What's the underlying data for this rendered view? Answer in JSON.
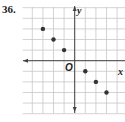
{
  "problem": {
    "number": "36."
  },
  "chart_data": {
    "type": "scatter",
    "title": "",
    "xlabel": "x",
    "ylabel": "y",
    "origin_label": "O",
    "xlim": [
      -5,
      5
    ],
    "ylim": [
      -5,
      5
    ],
    "grid": true,
    "x": [
      -3,
      -2,
      -1,
      1,
      2,
      3
    ],
    "y": [
      3,
      2,
      1,
      -1,
      -2,
      -3
    ],
    "points": [
      [
        -3,
        3
      ],
      [
        -2,
        2
      ],
      [
        -1,
        1
      ],
      [
        1,
        -1
      ],
      [
        2,
        -2
      ],
      [
        3,
        -3
      ]
    ]
  },
  "colors": {
    "grid": "#c8c8c8",
    "axis": "#444444",
    "point": "#333333"
  }
}
